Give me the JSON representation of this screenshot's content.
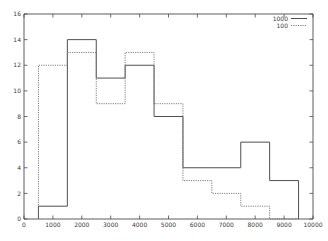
{
  "chart_data": {
    "type": "line",
    "style": "step-histogram",
    "title": "",
    "xlabel": "",
    "ylabel": "",
    "xlim": [
      0,
      10000
    ],
    "ylim": [
      0,
      16
    ],
    "xticks": [
      0,
      1000,
      2000,
      3000,
      4000,
      5000,
      6000,
      7000,
      8000,
      9000,
      10000
    ],
    "yticks": [
      0,
      2,
      4,
      6,
      8,
      10,
      12,
      14,
      16
    ],
    "xtick_labels": [
      "0",
      "1000",
      "2000",
      "3000",
      "4000",
      "5000",
      "6000",
      "7000",
      "8000",
      "9000",
      "10000"
    ],
    "ytick_labels": [
      "0",
      "2",
      "4",
      "6",
      "8",
      "10",
      "12",
      "14",
      "16"
    ],
    "grid": false,
    "legend_position": "top-right",
    "bin_edges": [
      500,
      1500,
      2500,
      3500,
      4500,
      5500,
      6500,
      7500,
      8500,
      9500
    ],
    "bin_centers": [
      1000,
      2000,
      3000,
      4000,
      5000,
      6000,
      7000,
      8000,
      9000
    ],
    "series": [
      {
        "name": "1000",
        "linestyle": "solid",
        "color": "#4f4f4f",
        "values": [
          1,
          14,
          11,
          12,
          8,
          4,
          4,
          6,
          3
        ]
      },
      {
        "name": "100",
        "linestyle": "dashed",
        "color": "#707070",
        "values": [
          12,
          13,
          9,
          13,
          9,
          3,
          2,
          1,
          0
        ]
      }
    ],
    "legend_entries": [
      "1000",
      "100"
    ]
  },
  "legend": {
    "items": [
      {
        "label": "1000"
      },
      {
        "label": "100"
      }
    ]
  }
}
